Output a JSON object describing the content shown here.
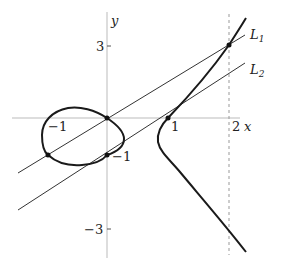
{
  "figure": {
    "axes": {
      "x_label": "x",
      "y_label": "y"
    },
    "tick_labels": {
      "x_neg1": "−1",
      "x_1": "1",
      "x_2": "2",
      "y_3": "3",
      "y_neg1": "−1",
      "y_neg3": "−3"
    },
    "lines": [
      {
        "name": "L",
        "sub": "1"
      },
      {
        "name": "L",
        "sub": "2"
      }
    ],
    "points": [
      {
        "x": 0,
        "y": 0
      },
      {
        "x": -1,
        "y": -1
      },
      {
        "x": 0,
        "y": -1
      },
      {
        "x": 1,
        "y": 0
      },
      {
        "x": 2,
        "y": 3
      }
    ],
    "colors": {
      "curve": "#1a1a1a",
      "axis": "#bbbbbb",
      "line": "#333333",
      "dashed": "#999999"
    }
  }
}
